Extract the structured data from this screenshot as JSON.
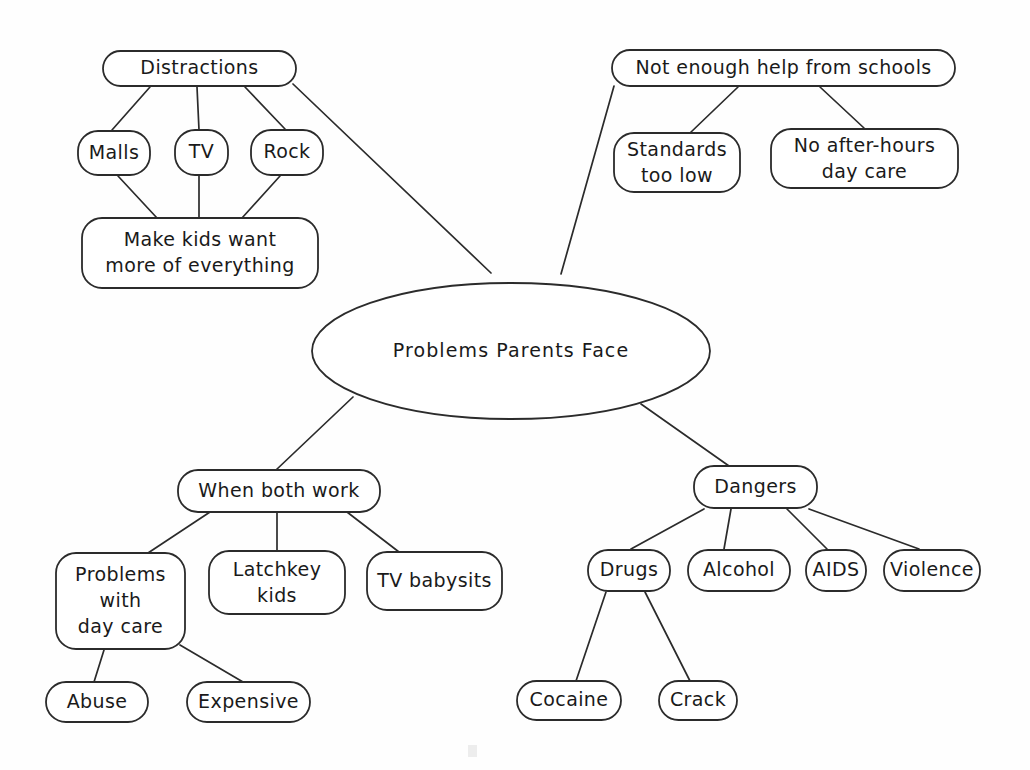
{
  "diagram": {
    "title": "Problems Parents Face",
    "type": "concept-map",
    "style": "hand-drawn",
    "stroke_color": "#2b2b2b",
    "background_color": "#ffffff",
    "central_node": {
      "id": "central",
      "label": "Problems Parents Face",
      "shape": "ellipse",
      "cx": 511,
      "cy": 351,
      "rx": 199,
      "ry": 68
    },
    "nodes": [
      {
        "id": "distractions",
        "label": "Distractions",
        "shape": "rounded-rect",
        "x": 103,
        "y": 51,
        "w": 193,
        "h": 35,
        "lines": [
          "Distractions"
        ]
      },
      {
        "id": "malls",
        "label": "Malls",
        "shape": "rounded-rect",
        "x": 78,
        "y": 131,
        "w": 72,
        "h": 44,
        "lines": [
          "Malls"
        ]
      },
      {
        "id": "tv",
        "label": "TV",
        "shape": "rounded-rect",
        "x": 175,
        "y": 130,
        "w": 53,
        "h": 45,
        "lines": [
          "TV"
        ]
      },
      {
        "id": "rock",
        "label": "Rock",
        "shape": "rounded-rect",
        "x": 251,
        "y": 130,
        "w": 72,
        "h": 45,
        "lines": [
          "Rock"
        ]
      },
      {
        "id": "make-kids-want",
        "label": "Make kids want more of everything",
        "shape": "rounded-rect",
        "x": 82,
        "y": 218,
        "w": 236,
        "h": 70,
        "lines": [
          "Make kids want",
          "more of everything"
        ]
      },
      {
        "id": "not-enough-help",
        "label": "Not enough help from schools",
        "shape": "rounded-rect",
        "x": 612,
        "y": 50,
        "w": 343,
        "h": 36,
        "lines": [
          "Not enough help from schools"
        ]
      },
      {
        "id": "standards-too-low",
        "label": "Standards too low",
        "shape": "rounded-rect",
        "x": 614,
        "y": 133,
        "w": 126,
        "h": 59,
        "lines": [
          "Standards",
          "too low"
        ]
      },
      {
        "id": "no-after-hours-day-care",
        "label": "No after-hours day care",
        "shape": "rounded-rect",
        "x": 771,
        "y": 129,
        "w": 187,
        "h": 59,
        "lines": [
          "No after-hours",
          "day care"
        ]
      },
      {
        "id": "when-both-work",
        "label": "When both work",
        "shape": "rounded-rect",
        "x": 178,
        "y": 470,
        "w": 202,
        "h": 42,
        "lines": [
          "When both work"
        ]
      },
      {
        "id": "problems-with-day-care",
        "label": "Problems with day care",
        "shape": "rounded-rect",
        "x": 56,
        "y": 553,
        "w": 129,
        "h": 96,
        "lines": [
          "Problems",
          "with",
          "day care"
        ]
      },
      {
        "id": "latchkey-kids",
        "label": "Latchkey kids",
        "shape": "rounded-rect",
        "x": 209,
        "y": 551,
        "w": 136,
        "h": 63,
        "lines": [
          "Latchkey",
          "kids"
        ]
      },
      {
        "id": "tv-babysits",
        "label": "TV babysits",
        "shape": "rounded-rect",
        "x": 367,
        "y": 552,
        "w": 135,
        "h": 58,
        "lines": [
          "TV babysits"
        ]
      },
      {
        "id": "abuse",
        "label": "Abuse",
        "shape": "rounded-rect",
        "x": 46,
        "y": 682,
        "w": 102,
        "h": 40,
        "lines": [
          "Abuse"
        ]
      },
      {
        "id": "expensive",
        "label": "Expensive",
        "shape": "rounded-rect",
        "x": 187,
        "y": 682,
        "w": 123,
        "h": 40,
        "lines": [
          "Expensive"
        ]
      },
      {
        "id": "dangers",
        "label": "Dangers",
        "shape": "rounded-rect",
        "x": 694,
        "y": 466,
        "w": 123,
        "h": 42,
        "lines": [
          "Dangers"
        ]
      },
      {
        "id": "drugs",
        "label": "Drugs",
        "shape": "rounded-rect",
        "x": 588,
        "y": 550,
        "w": 82,
        "h": 41,
        "lines": [
          "Drugs"
        ]
      },
      {
        "id": "alcohol",
        "label": "Alcohol",
        "shape": "rounded-rect",
        "x": 688,
        "y": 550,
        "w": 102,
        "h": 41,
        "lines": [
          "Alcohol"
        ]
      },
      {
        "id": "aids",
        "label": "AIDS",
        "shape": "rounded-rect",
        "x": 806,
        "y": 550,
        "w": 60,
        "h": 41,
        "lines": [
          "AIDS"
        ]
      },
      {
        "id": "violence",
        "label": "Violence",
        "shape": "rounded-rect",
        "x": 884,
        "y": 550,
        "w": 96,
        "h": 41,
        "lines": [
          "Violence"
        ]
      },
      {
        "id": "cocaine",
        "label": "Cocaine",
        "shape": "rounded-rect",
        "x": 517,
        "y": 681,
        "w": 104,
        "h": 39,
        "lines": [
          "Cocaine"
        ]
      },
      {
        "id": "crack",
        "label": "Crack",
        "shape": "rounded-rect",
        "x": 659,
        "y": 681,
        "w": 78,
        "h": 39,
        "lines": [
          "Crack"
        ]
      }
    ],
    "edges": [
      {
        "from": "distractions",
        "to": "central",
        "x1": 293,
        "y1": 84,
        "x2": 491,
        "y2": 273
      },
      {
        "from": "distractions",
        "to": "malls",
        "x1": 150,
        "y1": 87,
        "x2": 112,
        "y2": 130
      },
      {
        "from": "distractions",
        "to": "tv",
        "x1": 197,
        "y1": 87,
        "x2": 199,
        "y2": 130
      },
      {
        "from": "distractions",
        "to": "rock",
        "x1": 245,
        "y1": 87,
        "x2": 285,
        "y2": 129
      },
      {
        "from": "malls",
        "to": "make-kids-want",
        "x1": 118,
        "y1": 176,
        "x2": 157,
        "y2": 218
      },
      {
        "from": "tv",
        "to": "make-kids-want",
        "x1": 199,
        "y1": 176,
        "x2": 199,
        "y2": 218
      },
      {
        "from": "rock",
        "to": "make-kids-want",
        "x1": 280,
        "y1": 176,
        "x2": 242,
        "y2": 218
      },
      {
        "from": "central",
        "to": "not-enough-help",
        "x1": 561,
        "y1": 274,
        "x2": 614,
        "y2": 86
      },
      {
        "from": "not-enough-help",
        "to": "standards-too-low",
        "x1": 738,
        "y1": 87,
        "x2": 690,
        "y2": 133
      },
      {
        "from": "not-enough-help",
        "to": "no-after-hours-day-care",
        "x1": 820,
        "y1": 87,
        "x2": 864,
        "y2": 128
      },
      {
        "from": "central",
        "to": "when-both-work",
        "x1": 353,
        "y1": 397,
        "x2": 276,
        "y2": 470
      },
      {
        "from": "central",
        "to": "dangers",
        "x1": 641,
        "y1": 404,
        "x2": 729,
        "y2": 466
      },
      {
        "from": "when-both-work",
        "to": "problems-with-day-care",
        "x1": 210,
        "y1": 512,
        "x2": 148,
        "y2": 553
      },
      {
        "from": "when-both-work",
        "to": "latchkey-kids",
        "x1": 277,
        "y1": 512,
        "x2": 277,
        "y2": 551
      },
      {
        "from": "when-both-work",
        "to": "tv-babysits",
        "x1": 347,
        "y1": 512,
        "x2": 399,
        "y2": 552
      },
      {
        "from": "problems-with-day-care",
        "to": "abuse",
        "x1": 104,
        "y1": 650,
        "x2": 94,
        "y2": 682
      },
      {
        "from": "problems-with-day-care",
        "to": "expensive",
        "x1": 180,
        "y1": 645,
        "x2": 243,
        "y2": 682
      },
      {
        "from": "dangers",
        "to": "drugs",
        "x1": 704,
        "y1": 509,
        "x2": 631,
        "y2": 549
      },
      {
        "from": "dangers",
        "to": "alcohol",
        "x1": 731,
        "y1": 509,
        "x2": 724,
        "y2": 549
      },
      {
        "from": "dangers",
        "to": "aids",
        "x1": 787,
        "y1": 509,
        "x2": 827,
        "y2": 549
      },
      {
        "from": "dangers",
        "to": "violence",
        "x1": 809,
        "y1": 509,
        "x2": 919,
        "y2": 549
      },
      {
        "from": "drugs",
        "to": "cocaine",
        "x1": 606,
        "y1": 592,
        "x2": 576,
        "y2": 681
      },
      {
        "from": "drugs",
        "to": "crack",
        "x1": 645,
        "y1": 592,
        "x2": 690,
        "y2": 681
      }
    ]
  }
}
